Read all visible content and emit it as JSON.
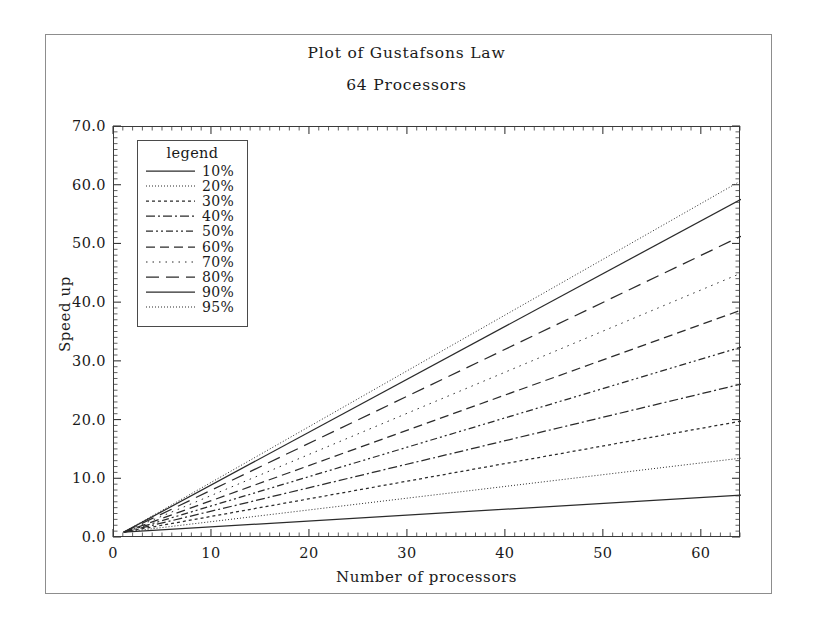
{
  "chart_data": {
    "type": "line",
    "title": "Plot of Gustafsons Law",
    "subtitle": "64 Processors",
    "xlabel": "Number of processors",
    "ylabel": "Speed up",
    "xlim": [
      0,
      64
    ],
    "ylim": [
      0,
      70
    ],
    "xticks": [
      0,
      10,
      20,
      30,
      40,
      50,
      60
    ],
    "yticks": [
      "0.0",
      "10.0",
      "20.0",
      "30.0",
      "40.0",
      "50.0",
      "60.0",
      "70.0"
    ],
    "ytick_values": [
      0,
      10,
      20,
      30,
      40,
      50,
      60,
      70
    ],
    "grid": false,
    "legend_position": "upper-left",
    "legend_title": "legend",
    "x": [
      1,
      64
    ],
    "series": [
      {
        "name": "10%",
        "dash": "solid",
        "values": [
          1,
          7.3
        ],
        "endpoint": 7.3
      },
      {
        "name": "20%",
        "dash": "fine-dotted",
        "values": [
          1,
          13.6
        ],
        "endpoint": 13.6
      },
      {
        "name": "30%",
        "dash": "dotted",
        "values": [
          1,
          19.9
        ],
        "endpoint": 19.9
      },
      {
        "name": "40%",
        "dash": "dashdot",
        "values": [
          1,
          26.2
        ],
        "endpoint": 26.2
      },
      {
        "name": "50%",
        "dash": "dashdotdot",
        "values": [
          1,
          32.5
        ],
        "endpoint": 32.5
      },
      {
        "name": "60%",
        "dash": "dashed",
        "values": [
          1,
          38.8
        ],
        "endpoint": 38.8
      },
      {
        "name": "70%",
        "dash": "sparse-dot",
        "values": [
          1,
          45.1
        ],
        "endpoint": 45.1
      },
      {
        "name": "80%",
        "dash": "long-dash",
        "values": [
          1,
          51.4
        ],
        "endpoint": 51.4
      },
      {
        "name": "90%",
        "dash": "solid",
        "values": [
          1,
          57.7
        ],
        "endpoint": 57.7
      },
      {
        "name": "95%",
        "dash": "fine-dotted",
        "values": [
          1,
          60.85
        ],
        "endpoint": 60.85
      }
    ],
    "line_color": "#2b2b2b"
  }
}
